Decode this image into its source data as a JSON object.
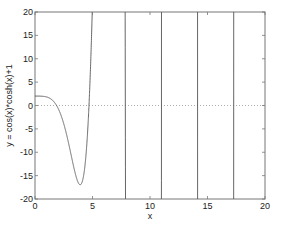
{
  "chart_data": {
    "type": "line",
    "title": "",
    "xlabel": "x",
    "ylabel": "y = cos(x)*cosh(x)+1",
    "xlim": [
      0,
      20
    ],
    "ylim": [
      -20,
      20
    ],
    "xticks": [
      0,
      5,
      10,
      15,
      20
    ],
    "yticks": [
      -20,
      -15,
      -10,
      -5,
      0,
      5,
      10,
      15,
      20
    ],
    "grid": false,
    "legend": null,
    "series": [
      {
        "name": "y = cos(x)*cosh(x)+1",
        "function": "cos(x)*cosh(x)+1",
        "color": "#555555",
        "x": [
          0,
          0.5,
          1.0,
          1.5,
          1.875,
          2.0,
          2.5,
          3.0,
          3.5,
          3.93,
          4.2,
          4.5,
          4.69,
          4.8,
          7.85,
          10.99,
          14.14,
          17.28
        ],
        "y": [
          2.0,
          1.99,
          1.83,
          1.17,
          0.0,
          -0.56,
          -4.0,
          -9.0,
          -14.6,
          -17.0,
          -15.0,
          -4.0,
          0.0,
          20,
          0,
          0,
          0,
          0
        ]
      },
      {
        "name": "zero-reference",
        "style": "dotted",
        "color": "#999999",
        "x": [
          0,
          20
        ],
        "y": [
          0,
          0
        ]
      }
    ],
    "annotations": []
  }
}
